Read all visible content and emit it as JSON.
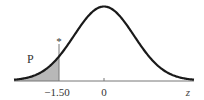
{
  "chart_data": {
    "type": "area",
    "title": "",
    "xlabel": "z",
    "ylabel": "",
    "xlim": [
      -3.0,
      3.0
    ],
    "distribution": {
      "name": "standard normal",
      "mean": 0,
      "sd": 1
    },
    "shaded_region": {
      "from": -3.0,
      "to": -1.5,
      "label": "P"
    },
    "marker": {
      "z": -1.5,
      "symbol": "*"
    },
    "tick_labels": [
      {
        "value": -1.5,
        "label": "−1.50"
      },
      {
        "value": 0,
        "label": "0"
      }
    ],
    "axis_end_label": "z",
    "colors": {
      "curve": "#1a1a1a",
      "shade": "#b8b8b8",
      "axis": "#777777"
    }
  }
}
